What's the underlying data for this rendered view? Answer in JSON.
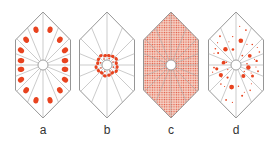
{
  "figure": {
    "colors": {
      "outline": "#8a8a8a",
      "spoke": "#a8a8a8",
      "particle": "#e8431f",
      "stipple_bg": "#f6c9bb",
      "stipple_dot": "#e0523a",
      "center_fill": "#ffffff"
    },
    "panels": [
      {
        "id": "a",
        "label": "a",
        "cx": 43,
        "pattern": "peripheral large blobs, one per sector"
      },
      {
        "id": "b",
        "label": "b",
        "cx": 107,
        "pattern": "small particles clustered around the center"
      },
      {
        "id": "c",
        "label": "c",
        "cx": 171,
        "pattern": "uniform fine stipple throughout"
      },
      {
        "id": "d",
        "label": "d",
        "cx": 236,
        "pattern": "scattered particles of mixed sizes"
      }
    ]
  }
}
